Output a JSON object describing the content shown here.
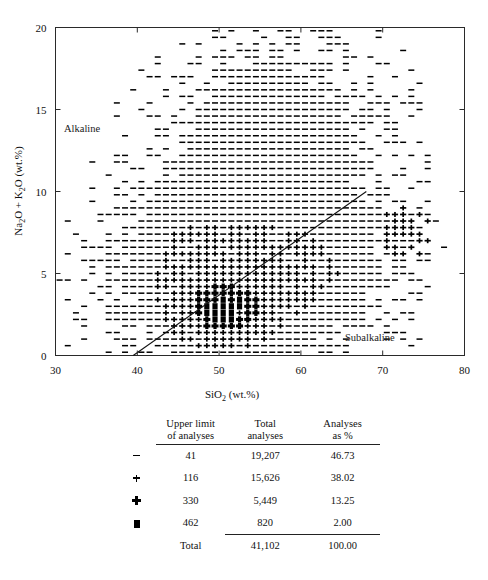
{
  "figure": {
    "field_labels": {
      "alkaline": "Alkaline",
      "subalkaline": "Subalkaline"
    },
    "axes": {
      "x_title_main": "SiO",
      "x_title_sub": "2",
      "x_title_tail": " (wt.%)",
      "y_title_a": "Na",
      "y_title_a_sub": "2",
      "y_title_mid": "O + K",
      "y_title_b_sub": "2",
      "y_title_tail": "O  (wt.%)",
      "x_ticks": [
        "30",
        "40",
        "50",
        "60",
        "70",
        "80"
      ],
      "y_ticks": [
        "0",
        "5",
        "10",
        "15",
        "20"
      ]
    }
  },
  "table": {
    "headers": {
      "symbol": "",
      "upper_limit_l1": "Upper limit",
      "upper_limit_l2": "of analyses",
      "total_l1": "Total",
      "total_l2": "analyses",
      "pct_l1": "Analyses",
      "pct_l2": "as %"
    },
    "rows": [
      {
        "symbol": "dash-marker",
        "upper_limit": "41",
        "total": "19,207",
        "pct": "46.73"
      },
      {
        "symbol": "cross-marker",
        "upper_limit": "116",
        "total": "15,626",
        "pct": "38.02"
      },
      {
        "symbol": "diamond-marker",
        "upper_limit": "330",
        "total": "5,449",
        "pct": "13.25"
      },
      {
        "symbol": "square-marker",
        "upper_limit": "462",
        "total": "820",
        "pct": "2.00"
      }
    ],
    "totals": {
      "label": "Total",
      "total": "41,102",
      "pct": "100.00"
    }
  },
  "chart_data": {
    "type": "scatter",
    "title": "",
    "xlabel": "SiO2 (wt.%)",
    "ylabel": "Na2O + K2O (wt.%)",
    "xlim": [
      30,
      80
    ],
    "ylim": [
      0,
      20
    ],
    "xticks": [
      30,
      40,
      50,
      60,
      70,
      80
    ],
    "yticks": [
      0,
      5,
      10,
      15,
      20
    ],
    "grid": false,
    "legend_position": "below-plot-as-table",
    "annotations": [
      {
        "text": "Alkaline",
        "x": 35.5,
        "y": 13.8
      },
      {
        "text": "Subalkaline",
        "x": 67.5,
        "y": 1.5
      }
    ],
    "divider_line": {
      "name": "alkaline-subalkaline-divider",
      "points": [
        [
          39.5,
          0.0
        ],
        [
          68.0,
          10.0
        ]
      ]
    },
    "density_bins": {
      "description": "Binned density of 41,102 volcanic rock analyses on a TAS diagram; marker size encodes count per bin",
      "bin_size_x": 1.0,
      "bin_size_y": 0.4,
      "classes": [
        {
          "symbol": "dash",
          "upper_limit": 41,
          "total_analyses": 19207,
          "percent": 46.73
        },
        {
          "symbol": "cross",
          "upper_limit": 116,
          "total_analyses": 15626,
          "percent": 38.02
        },
        {
          "symbol": "diamond",
          "upper_limit": 330,
          "total_analyses": 5449,
          "percent": 13.25
        },
        {
          "symbol": "square",
          "upper_limit": 462,
          "total_analyses": 820,
          "percent": 2.0
        }
      ],
      "total_analyses": 41102,
      "total_percent": 100.0,
      "peak_mode": {
        "x": 50.5,
        "y": 2.8,
        "symbol": "square"
      },
      "secondary_mode": {
        "x": 73.0,
        "y": 7.6,
        "symbol": "diamond"
      }
    }
  }
}
